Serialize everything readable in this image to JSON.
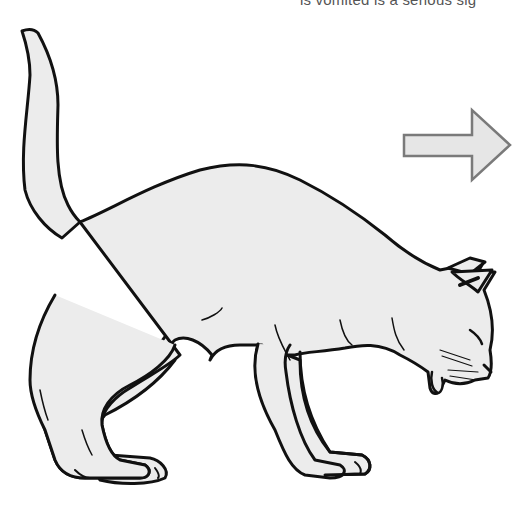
{
  "caption": {
    "text": "is vomited is a serious sig"
  },
  "illustration": {
    "subject": "cat-hunched-vomiting",
    "fill_color": "#ececec",
    "outline_color": "#111111"
  },
  "arrow": {
    "direction": "right",
    "fill_color": "#e6e6e6",
    "stroke_color": "#7a7a7a"
  }
}
